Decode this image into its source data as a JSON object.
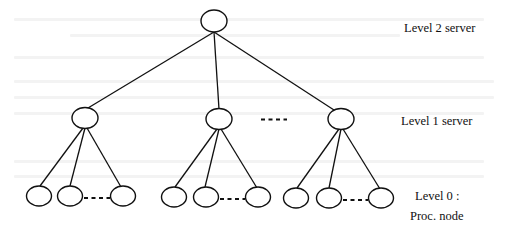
{
  "diagram": {
    "type": "tree",
    "colors": {
      "ink": "#111111",
      "background": "#ffffff"
    },
    "labels": {
      "level2": "Level 2 server",
      "level1": "Level 1 server",
      "level0_line1": "Level 0 :",
      "level0_line2": "Proc. node"
    },
    "levels": [
      {
        "level": 2,
        "name": "Level 2 server",
        "nodes": 1
      },
      {
        "level": 1,
        "name": "Level 1 server",
        "nodes": "3 shown, more elided with ellipsis"
      },
      {
        "level": 0,
        "name": "Proc. node",
        "nodes": "3 per group shown, more elided with ellipsis"
      }
    ]
  }
}
